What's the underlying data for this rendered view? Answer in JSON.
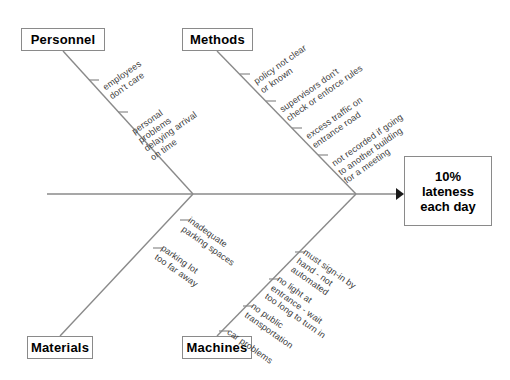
{
  "diagram": {
    "type": "fishbone-cause-and-effect",
    "effect": {
      "lines": [
        "10%",
        "lateness",
        "each day"
      ],
      "text": "10% lateness each day"
    },
    "categories": [
      {
        "key": "personnel",
        "label": "Personnel",
        "position": "top-left",
        "causes": [
          {
            "lines": [
              "employees",
              "don't care"
            ]
          },
          {
            "lines": [
              "personal",
              "problems",
              "delaying arrival",
              "on time"
            ]
          }
        ]
      },
      {
        "key": "methods",
        "label": "Methods",
        "position": "top-right",
        "causes": [
          {
            "lines": [
              "policy not clear",
              "or known"
            ]
          },
          {
            "lines": [
              "supervisors don't",
              "check or enforce rules"
            ]
          },
          {
            "lines": [
              "excess traffic on",
              "entrance road"
            ]
          },
          {
            "lines": [
              "not recorded if going",
              "to another building",
              "for a meeting"
            ]
          }
        ]
      },
      {
        "key": "materials",
        "label": "Materials",
        "position": "bottom-left",
        "causes": [
          {
            "lines": [
              "inadequate",
              "parking spaces"
            ]
          },
          {
            "lines": [
              "parking lot",
              "too far away"
            ]
          }
        ]
      },
      {
        "key": "machines",
        "label": "Machines",
        "position": "bottom-right",
        "causes": [
          {
            "lines": [
              "must sign-in by",
              "hand - not",
              "automated"
            ]
          },
          {
            "lines": [
              "no light at",
              "entrance - wait",
              "too long to turn in"
            ]
          },
          {
            "lines": [
              "no public",
              "transportation"
            ]
          },
          {
            "lines": [
              "car problems"
            ]
          }
        ]
      }
    ],
    "colors": {
      "line": "#8a8a8a",
      "box_border": "#8a8a8a",
      "label_text": "#000000",
      "cause_text": "#3c3c3c",
      "background": "#ffffff"
    }
  }
}
